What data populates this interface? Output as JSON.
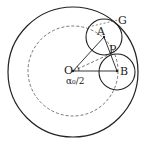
{
  "diagram": {
    "labels": {
      "O": "O",
      "A": "A",
      "B": "B",
      "P": "P",
      "G": "G",
      "angle": "α₀/2"
    },
    "elements": [
      "outer-circle",
      "dashed-circle-through-A-B",
      "circle-A",
      "circle-B",
      "line-OA",
      "line-OB",
      "dashed-line-OP",
      "line-AB",
      "angle-arc"
    ]
  }
}
